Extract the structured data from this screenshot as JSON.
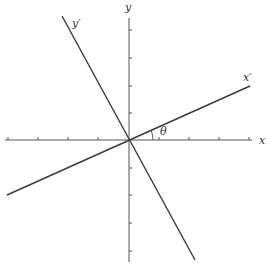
{
  "diagram": {
    "labels": {
      "x": "x",
      "y": "y",
      "x_prime": "x′",
      "y_prime": "y′",
      "angle": "θ"
    },
    "colors": {
      "axis": "#555555",
      "rotated": "#3a3a3a",
      "background": "#ffffff"
    },
    "origin": [
      129,
      140
    ],
    "x_ticks": [
      22,
      58,
      95,
      165,
      200,
      236
    ],
    "y_ticks": [
      34,
      70,
      105,
      176,
      211,
      247
    ]
  }
}
